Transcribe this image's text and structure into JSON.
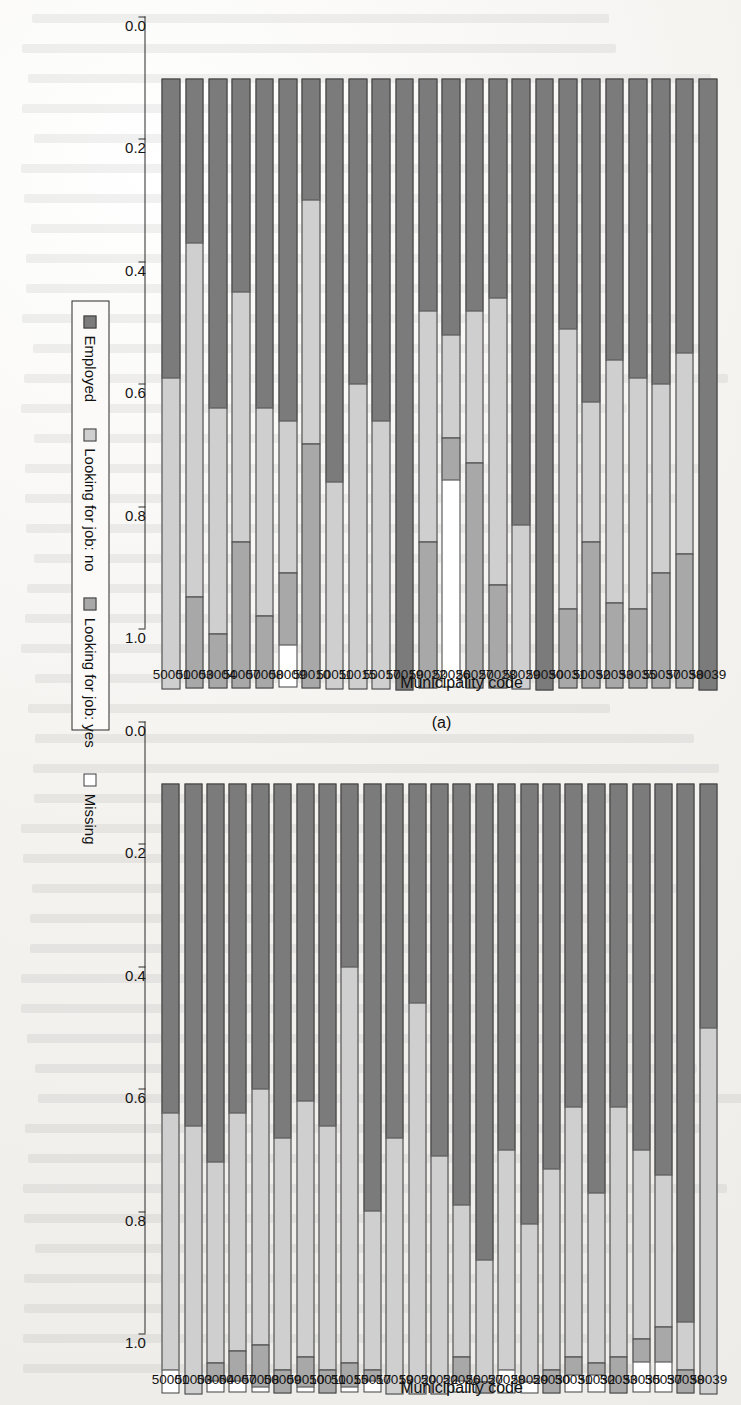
{
  "figure": {
    "axis_title": "Municipality code",
    "panel_a_tag": "(a)",
    "panel_b_tag": "(b)"
  },
  "legend": {
    "items": [
      {
        "label": "Employed",
        "color": "#7b7b7b"
      },
      {
        "label": "Looking for job: no",
        "color": "#cfcfcf"
      },
      {
        "label": "Looking for job: yes",
        "color": "#a8a8a8"
      },
      {
        "label": "Missing",
        "color": "#ffffff"
      }
    ]
  },
  "axis": {
    "ticks": [
      0.0,
      0.2,
      0.4,
      0.6,
      0.8,
      1.0
    ],
    "tick_labels": [
      "0.0",
      "0.2",
      "0.4",
      "0.6",
      "0.8",
      "1.0"
    ],
    "min": 0.0,
    "max": 1.0
  },
  "chart_data": [
    {
      "type": "bar",
      "id": "panel-a",
      "title": "(a)",
      "orientation": "horizontal-stacked",
      "stacked": true,
      "normalized": true,
      "xlabel": "",
      "ylabel": "Municipality code",
      "xlim": [
        0.0,
        1.0
      ],
      "grid": false,
      "legend_position": "top",
      "series": [
        {
          "name": "Employed",
          "color": "#7b7b7b"
        },
        {
          "name": "Looking for job: no",
          "color": "#cfcfcf"
        },
        {
          "name": "Looking for job: yes",
          "color": "#a8a8a8"
        },
        {
          "name": "Missing",
          "color": "#ffffff"
        }
      ],
      "categories": [
        "50001",
        "50003",
        "50004",
        "50007",
        "50008",
        "50009",
        "50010",
        "50011",
        "50015",
        "50017",
        "50019",
        "50022",
        "50026",
        "50027",
        "50028",
        "50029",
        "50030",
        "50031",
        "50032",
        "50033",
        "50035",
        "50037",
        "50038",
        "50039"
      ],
      "rows": [
        {
          "category": "50001",
          "values": [
            0.49,
            0.51,
            0.0,
            0.0
          ]
        },
        {
          "category": "50003",
          "values": [
            0.27,
            0.58,
            0.15,
            0.0
          ]
        },
        {
          "category": "50004",
          "values": [
            0.54,
            0.37,
            0.09,
            0.0
          ]
        },
        {
          "category": "50007",
          "values": [
            0.35,
            0.41,
            0.24,
            0.0
          ]
        },
        {
          "category": "50008",
          "values": [
            0.54,
            0.34,
            0.12,
            0.0
          ]
        },
        {
          "category": "50009",
          "values": [
            0.56,
            0.25,
            0.12,
            0.07
          ]
        },
        {
          "category": "50010",
          "values": [
            0.2,
            0.4,
            0.4,
            0.0
          ]
        },
        {
          "category": "50011",
          "values": [
            0.66,
            0.34,
            0.0,
            0.0
          ]
        },
        {
          "category": "50015",
          "values": [
            0.5,
            0.5,
            0.0,
            0.0
          ]
        },
        {
          "category": "50017",
          "values": [
            0.56,
            0.44,
            0.0,
            0.0
          ]
        },
        {
          "category": "50019",
          "values": [
            1.0,
            0.0,
            0.0,
            0.0
          ]
        },
        {
          "category": "50022",
          "values": [
            0.38,
            0.38,
            0.24,
            0.0
          ]
        },
        {
          "category": "50026",
          "values": [
            0.42,
            0.17,
            0.07,
            0.34
          ]
        },
        {
          "category": "50027",
          "values": [
            0.38,
            0.25,
            0.37,
            0.0
          ]
        },
        {
          "category": "50028",
          "values": [
            0.36,
            0.47,
            0.17,
            0.0
          ]
        },
        {
          "category": "50029",
          "values": [
            0.73,
            0.27,
            0.0,
            0.0
          ]
        },
        {
          "category": "50030",
          "values": [
            1.0,
            0.0,
            0.0,
            0.0
          ]
        },
        {
          "category": "50031",
          "values": [
            0.41,
            0.46,
            0.13,
            0.0
          ]
        },
        {
          "category": "50032",
          "values": [
            0.53,
            0.23,
            0.24,
            0.0
          ]
        },
        {
          "category": "50033",
          "values": [
            0.46,
            0.4,
            0.14,
            0.0
          ]
        },
        {
          "category": "50035",
          "values": [
            0.49,
            0.38,
            0.13,
            0.0
          ]
        },
        {
          "category": "50037",
          "values": [
            0.5,
            0.31,
            0.19,
            0.0
          ]
        },
        {
          "category": "50038",
          "values": [
            0.45,
            0.33,
            0.22,
            0.0
          ]
        },
        {
          "category": "50039",
          "values": [
            1.0,
            0.0,
            0.0,
            0.0
          ]
        }
      ]
    },
    {
      "type": "bar",
      "id": "panel-b",
      "title": "(b)",
      "orientation": "horizontal-stacked",
      "stacked": true,
      "normalized": true,
      "xlabel": "",
      "ylabel": "Municipality code",
      "xlim": [
        0.0,
        1.0
      ],
      "grid": false,
      "legend_position": "top",
      "series": [
        {
          "name": "Employed",
          "color": "#7b7b7b"
        },
        {
          "name": "Looking for job: no",
          "color": "#cfcfcf"
        },
        {
          "name": "Looking for job: yes",
          "color": "#a8a8a8"
        },
        {
          "name": "Missing",
          "color": "#ffffff"
        }
      ],
      "categories": [
        "50001",
        "50003",
        "50004",
        "50007",
        "50008",
        "50009",
        "50010",
        "50011",
        "50015",
        "50017",
        "50019",
        "50020",
        "50022",
        "50026",
        "50027",
        "50028",
        "50029",
        "50030",
        "50031",
        "50032",
        "50033",
        "50035",
        "50037",
        "50038",
        "50039"
      ],
      "rows": [
        {
          "category": "50001",
          "values": [
            0.54,
            0.42,
            0.0,
            0.04
          ]
        },
        {
          "category": "50003",
          "values": [
            0.56,
            0.44,
            0.0,
            0.0
          ]
        },
        {
          "category": "50004",
          "values": [
            0.62,
            0.33,
            0.03,
            0.02
          ]
        },
        {
          "category": "50007",
          "values": [
            0.54,
            0.39,
            0.05,
            0.02
          ]
        },
        {
          "category": "50008",
          "values": [
            0.5,
            0.42,
            0.07,
            0.01
          ]
        },
        {
          "category": "50009",
          "values": [
            0.58,
            0.38,
            0.04,
            0.0
          ]
        },
        {
          "category": "50010",
          "values": [
            0.52,
            0.42,
            0.05,
            0.01
          ]
        },
        {
          "category": "50011",
          "values": [
            0.56,
            0.4,
            0.04,
            0.0
          ]
        },
        {
          "category": "50015",
          "values": [
            0.3,
            0.65,
            0.04,
            0.01
          ]
        },
        {
          "category": "50017",
          "values": [
            0.7,
            0.26,
            0.02,
            0.02
          ]
        },
        {
          "category": "50019",
          "values": [
            0.58,
            0.42,
            0.0,
            0.0
          ]
        },
        {
          "category": "50020",
          "values": [
            0.36,
            0.64,
            0.0,
            0.0
          ]
        },
        {
          "category": "50022",
          "values": [
            0.61,
            0.39,
            0.0,
            0.0
          ]
        },
        {
          "category": "50026",
          "values": [
            0.69,
            0.25,
            0.04,
            0.02
          ]
        },
        {
          "category": "50027",
          "values": [
            0.78,
            0.2,
            0.02,
            0.0
          ]
        },
        {
          "category": "50028",
          "values": [
            0.6,
            0.36,
            0.0,
            0.04
          ]
        },
        {
          "category": "50029",
          "values": [
            0.72,
            0.26,
            0.0,
            0.02
          ]
        },
        {
          "category": "50030",
          "values": [
            0.63,
            0.33,
            0.04,
            0.0
          ]
        },
        {
          "category": "50031",
          "values": [
            0.53,
            0.41,
            0.03,
            0.03
          ]
        },
        {
          "category": "50032",
          "values": [
            0.67,
            0.28,
            0.02,
            0.03
          ]
        },
        {
          "category": "50033",
          "values": [
            0.53,
            0.41,
            0.06,
            0.0
          ]
        },
        {
          "category": "50035",
          "values": [
            0.6,
            0.31,
            0.04,
            0.05
          ]
        },
        {
          "category": "50037",
          "values": [
            0.64,
            0.25,
            0.06,
            0.05
          ]
        },
        {
          "category": "50038",
          "values": [
            0.88,
            0.08,
            0.04,
            0.0
          ]
        },
        {
          "category": "50039",
          "values": [
            0.4,
            0.6,
            0.0,
            0.0
          ]
        }
      ]
    }
  ]
}
